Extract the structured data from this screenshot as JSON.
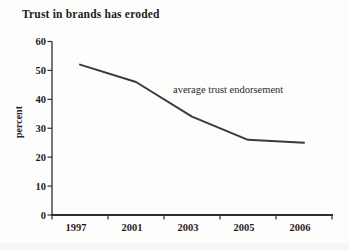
{
  "title": "Trust in brands has eroded",
  "annotation": "average trust endorsement",
  "colors": {
    "line": "#3a3a3a",
    "axis": "#2e2e2e",
    "text": "#1d1d1d"
  },
  "chart_data": {
    "type": "line",
    "title": "Trust in brands has eroded",
    "categories": [
      "1997",
      "2001",
      "2003",
      "2005",
      "2006"
    ],
    "series": [
      {
        "name": "average trust endorsement",
        "values": [
          52,
          46,
          34,
          26,
          25
        ]
      }
    ],
    "xlabel": "",
    "ylabel": "percent",
    "ylim": [
      0,
      60
    ],
    "yticks": [
      0,
      10,
      20,
      30,
      40,
      50,
      60
    ],
    "grid": false,
    "legend_position": "inline-annotation",
    "markers": false
  }
}
